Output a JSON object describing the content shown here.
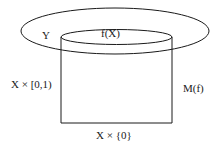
{
  "diagram": {
    "labels": {
      "space_y": "Y",
      "image_fx": "f(X)",
      "cylinder_side": "X × [0,1)",
      "mapping_cylinder": "M(f)",
      "base": "X × {0}"
    },
    "colors": {
      "stroke": "#1a1a1a",
      "background": "#ffffff"
    }
  }
}
